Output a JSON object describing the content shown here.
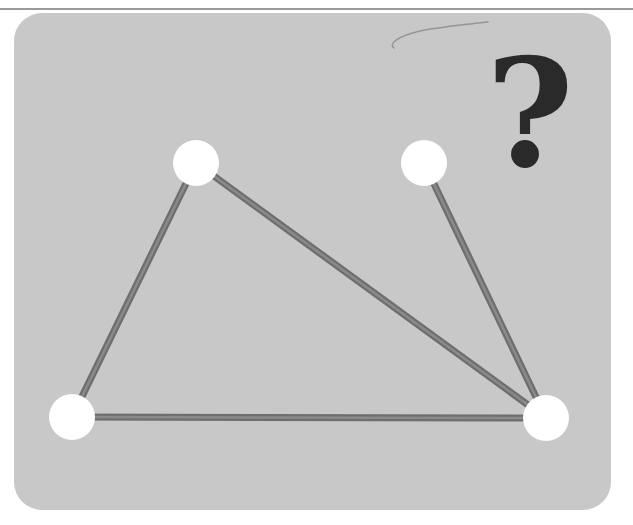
{
  "figure": {
    "symbol": "?",
    "colors": {
      "background": "#ffffff",
      "card": "#c8c8c8",
      "edge": "#6e6e6e",
      "edge_highlight": "#8a8a8a",
      "node": "#ffffff",
      "symbol": "#2a2a2a",
      "pencil_mark": "#8c8c8c"
    },
    "graph": {
      "nodes": [
        {
          "id": "n1",
          "x": 196,
          "y": 163,
          "r": 23
        },
        {
          "id": "n2",
          "x": 424,
          "y": 163,
          "r": 23
        },
        {
          "id": "n3",
          "x": 72,
          "y": 417,
          "r": 23
        },
        {
          "id": "n4",
          "x": 546,
          "y": 418,
          "r": 23
        }
      ],
      "edges": [
        {
          "from": "n1",
          "to": "n3"
        },
        {
          "from": "n1",
          "to": "n4"
        },
        {
          "from": "n2",
          "to": "n4"
        },
        {
          "from": "n3",
          "to": "n4"
        }
      ]
    }
  }
}
